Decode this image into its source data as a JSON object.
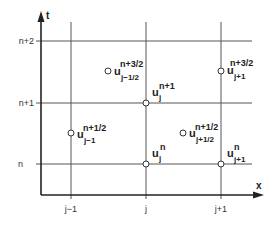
{
  "diagram": {
    "type": "staggered space-time grid",
    "axes": {
      "x_label": "x",
      "t_label": "t"
    },
    "x_ticks": [
      {
        "label": "j−1",
        "x": 71
      },
      {
        "label": "j",
        "x": 146
      },
      {
        "label": "j+1",
        "x": 221
      }
    ],
    "t_ticks": [
      {
        "label": "n+2",
        "y": 41
      },
      {
        "label": "n+1",
        "y": 103
      },
      {
        "label": "n",
        "y": 164
      }
    ],
    "points": [
      {
        "base": "u",
        "sub": "j−1",
        "sup": "n+1/2",
        "cx": 71,
        "cy": 133
      },
      {
        "base": "u",
        "sub": "j−1/2",
        "sup": "n+3/2",
        "cx": 108,
        "cy": 71
      },
      {
        "base": "u",
        "sub": "j",
        "sup": "n+1",
        "cx": 146,
        "cy": 103
      },
      {
        "base": "u",
        "sub": "j+1",
        "sup": "n+3/2",
        "cx": 221,
        "cy": 71
      },
      {
        "base": "u",
        "sub": "j+1/2",
        "sup": "n+1/2",
        "cx": 183,
        "cy": 133
      },
      {
        "base": "u",
        "sub": "j",
        "sup": "n",
        "cx": 146,
        "cy": 164
      },
      {
        "base": "u",
        "sub": "j+1",
        "sup": "n",
        "cx": 221,
        "cy": 164
      }
    ],
    "colors": {
      "axis": "#222222",
      "grid": "#555555",
      "point_fill": "#ffffff",
      "point_stroke": "#333333"
    }
  }
}
